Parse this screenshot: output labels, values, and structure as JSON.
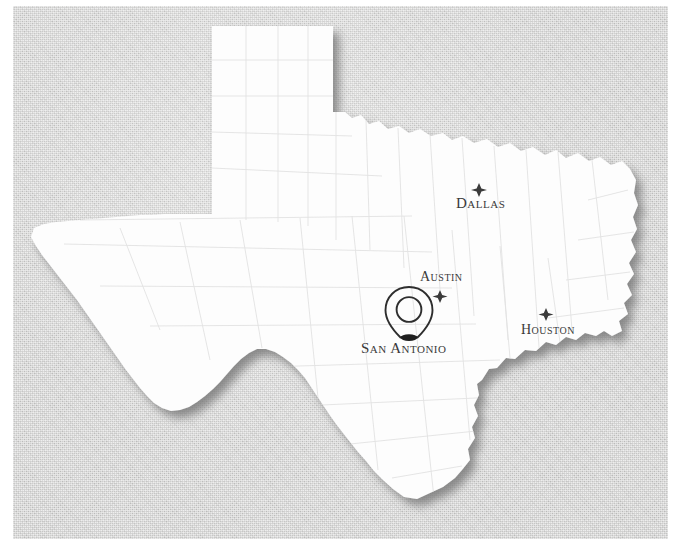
{
  "figure": {
    "kind": "photographed-paper-map",
    "background_color": "#d4d4d3",
    "landmass_color": "#fdfdfd",
    "shadow_color": "#8e8e8e",
    "county_line_color": "#dcdcdc",
    "ink_color": "#3a3a3a"
  },
  "cities": [
    {
      "id": "dallas",
      "name": "Dallas",
      "marker": "star-icon",
      "marker_x": 479,
      "marker_y": 190,
      "label_x": 456,
      "label_y": 196,
      "label_position": "below"
    },
    {
      "id": "austin",
      "name": "Austin",
      "marker": "star-icon",
      "marker_x": 440,
      "marker_y": 296,
      "label_x": 420,
      "label_y": 270,
      "label_position": "above"
    },
    {
      "id": "houston",
      "name": "Houston",
      "marker": "star-icon",
      "marker_x": 546,
      "marker_y": 314,
      "label_x": 521,
      "label_y": 323,
      "label_position": "below"
    },
    {
      "id": "san-antonio",
      "name": "San Antonio",
      "marker": "map-pin-icon",
      "marker_x": 409,
      "marker_y": 336,
      "label_x": 361,
      "label_y": 341,
      "label_position": "below",
      "highlighted": true
    }
  ],
  "markers": {
    "pin_label": "San Antonio location pin",
    "star_label": "city star marker"
  }
}
